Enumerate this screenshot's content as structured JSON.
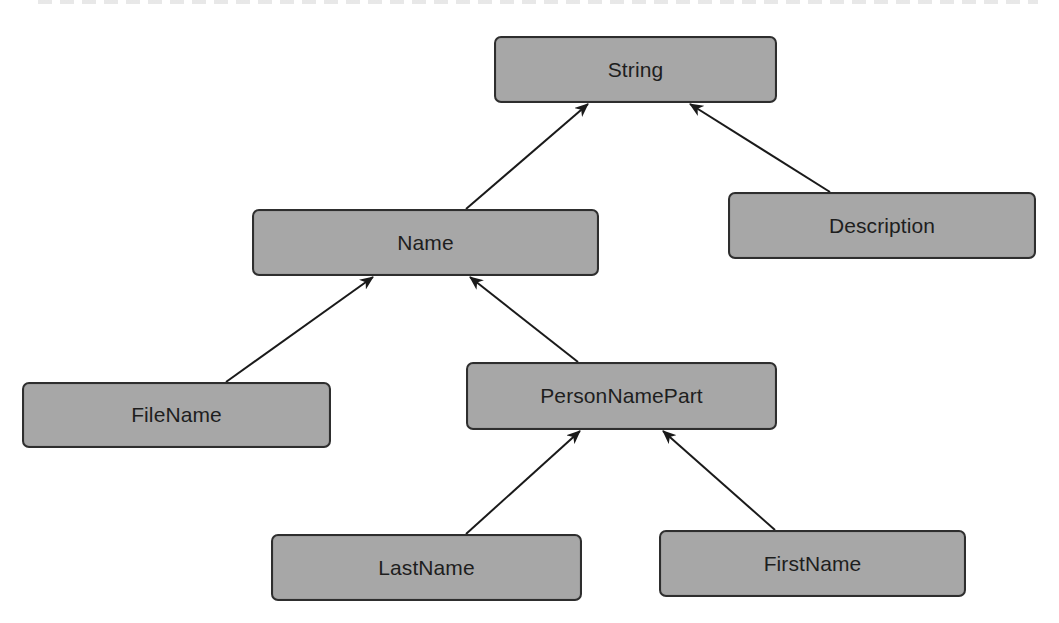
{
  "diagram": {
    "type": "type-hierarchy",
    "node_fill": "#a7a7a7",
    "node_border": "#2e2e2e",
    "edge_color": "#1a1a1a",
    "nodes": [
      {
        "id": "string",
        "label": "String",
        "x": 494,
        "y": 36,
        "w": 283,
        "h": 67
      },
      {
        "id": "name",
        "label": "Name",
        "x": 252,
        "y": 209,
        "w": 347,
        "h": 67
      },
      {
        "id": "description",
        "label": "Description",
        "x": 728,
        "y": 192,
        "w": 308,
        "h": 67
      },
      {
        "id": "filename",
        "label": "FileName",
        "x": 22,
        "y": 382,
        "w": 309,
        "h": 66
      },
      {
        "id": "personnamepart",
        "label": "PersonNamePart",
        "x": 466,
        "y": 362,
        "w": 311,
        "h": 68
      },
      {
        "id": "lastname",
        "label": "LastName",
        "x": 271,
        "y": 534,
        "w": 311,
        "h": 67
      },
      {
        "id": "firstname",
        "label": "FirstName",
        "x": 659,
        "y": 530,
        "w": 307,
        "h": 67
      }
    ],
    "edges": [
      {
        "from": "name",
        "to": "string",
        "x1": 466,
        "y1": 209,
        "x2": 588,
        "y2": 104
      },
      {
        "from": "description",
        "to": "string",
        "x1": 830,
        "y1": 192,
        "x2": 690,
        "y2": 104
      },
      {
        "from": "filename",
        "to": "name",
        "x1": 226,
        "y1": 382,
        "x2": 373,
        "y2": 277
      },
      {
        "from": "personnamepart",
        "to": "name",
        "x1": 578,
        "y1": 362,
        "x2": 470,
        "y2": 277
      },
      {
        "from": "lastname",
        "to": "personnamepart",
        "x1": 466,
        "y1": 534,
        "x2": 580,
        "y2": 431
      },
      {
        "from": "firstname",
        "to": "personnamepart",
        "x1": 775,
        "y1": 530,
        "x2": 663,
        "y2": 431
      }
    ]
  }
}
